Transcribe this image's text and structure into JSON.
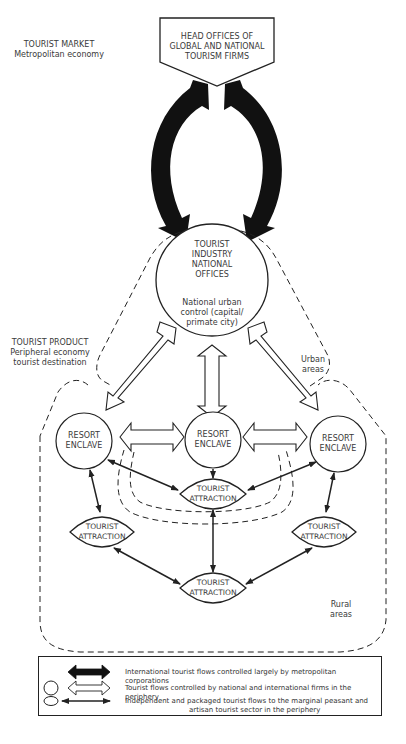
{
  "labels": {
    "tourist_market": {
      "title": "TOURIST MARKET",
      "subtitle": "Metropolitan economy"
    },
    "head_offices": {
      "line1": "HEAD OFFICES OF",
      "line2": "GLOBAL AND NATIONAL",
      "line3": "TOURISM FIRMS"
    },
    "national_offices": {
      "line1": "TOURIST",
      "line2": "INDUSTRY",
      "line3": "NATIONAL",
      "line4": "OFFICES",
      "sub1": "National urban",
      "sub2": "control (capital/",
      "sub3": "primate city)"
    },
    "tourist_product": {
      "title": "TOURIST PRODUCT",
      "sub1": "Peripheral economy",
      "sub2": "tourist destination"
    },
    "urban_areas": {
      "line1": "Urban",
      "line2": "areas"
    },
    "rural_areas": {
      "line1": "Rural",
      "line2": "areas"
    },
    "resort_left": {
      "line1": "RESORT",
      "line2": "ENCLAVE"
    },
    "resort_center": {
      "line1": "RESORT",
      "line2": "ENCLAVE"
    },
    "resort_right": {
      "line1": "RESORT",
      "line2": "ENCLAVE"
    },
    "attraction_center": {
      "line1": "TOURIST",
      "line2": "ATTRACTION"
    },
    "attraction_left": {
      "line1": "TOURIST",
      "line2": "ATTRACTION"
    },
    "attraction_right": {
      "line1": "TOURIST",
      "line2": "ATTRACTION"
    },
    "attraction_bottom": {
      "line1": "TOURIST",
      "line2": "ATTRACTION"
    }
  },
  "legend": {
    "items": [
      {
        "icon": "black-double-arrow-icon",
        "text": "International tourist flows controlled largely by metropolitan corporations"
      },
      {
        "icon": "white-double-arrow-icon",
        "text": "Tourist flows controlled by national and international firms in the periphery"
      },
      {
        "icon": "thin-double-arrow-icon",
        "text_line1": "Independent and packaged tourist flows to the marginal peasant and",
        "text_line2": "artisan tourist sector in the periphery"
      }
    ]
  },
  "colors": {
    "ink": "#222222",
    "text": "#3a3a3a",
    "background": "#ffffff"
  }
}
